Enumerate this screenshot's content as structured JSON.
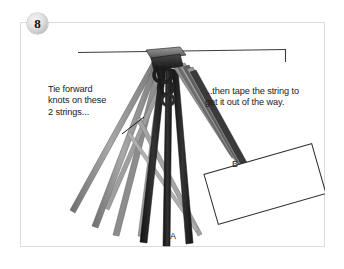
{
  "figure": {
    "step_number": "8",
    "background_color": "#ffffff",
    "frame_color": "#dcdcdc"
  },
  "captions": {
    "left": "Tie forward\nknots on these\n2 strings...",
    "right": "...then tape the string to\nget it out of the way."
  },
  "part_labels": {
    "a": "A",
    "b": "B"
  },
  "colors": {
    "string_dark": "#1c1c1c",
    "string_gray": "#8d8d8d",
    "string_midgray": "#6e6e6e",
    "knot_dark": "#272727",
    "bar_line": "#3b3b3b",
    "tape_fill": "#ffffff",
    "tape_border": "#2b2b2b",
    "badge_text": "#111111"
  },
  "diagram": {
    "type": "instructional-line-drawing",
    "horizontal_bar": {
      "x1": 58,
      "y1": 30,
      "x2": 266,
      "y2": 27,
      "end_tick_height": 13
    },
    "knot_anchor": {
      "x": 135,
      "y": 36
    },
    "tape_card": {
      "label": "B",
      "rotation_deg": -16,
      "center_x": 245,
      "center_y": 162,
      "width": 112,
      "height": 52
    },
    "leader_line": {
      "x1": 104,
      "y1": 110,
      "x2": 122,
      "y2": 97
    },
    "strings": [
      {
        "name": "gray-left-outer",
        "tone": "gray",
        "x2": 52,
        "y2": 190
      },
      {
        "name": "gray-left-inner",
        "tone": "gray",
        "x2": 74,
        "y2": 207
      },
      {
        "name": "gray-mid-left",
        "tone": "midgray",
        "x2": 96,
        "y2": 216
      },
      {
        "name": "dark-left",
        "tone": "dark",
        "x2": 125,
        "y2": 222
      },
      {
        "name": "dark-center",
        "tone": "dark",
        "x2": 148,
        "y2": 226
      },
      {
        "name": "dark-right",
        "tone": "dark",
        "x2": 170,
        "y2": 224
      },
      {
        "name": "gray-taped-bundle",
        "tone": "gray",
        "x2": 214,
        "y2": 140
      }
    ]
  }
}
